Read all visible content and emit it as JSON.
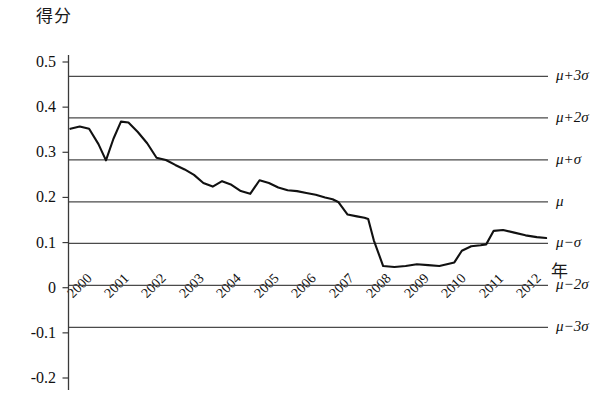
{
  "chart_data": {
    "type": "line",
    "title": "",
    "ylabel": "得分",
    "xlabel": "年",
    "ylim": [
      -0.2,
      0.5
    ],
    "xlim": [
      2000,
      2012.8
    ],
    "grid": "horizontal-reference-lines-only",
    "legend": "none",
    "ytick_labels": [
      "0.5",
      "0.4",
      "0.3",
      "0.2",
      "0.1",
      "0",
      "-0.1",
      "-0.2"
    ],
    "ytick_values": [
      0.5,
      0.4,
      0.3,
      0.2,
      0.1,
      0,
      -0.1,
      -0.2
    ],
    "xtick_labels": [
      "2000",
      "2001",
      "2002",
      "2003",
      "2004",
      "2005",
      "2006",
      "2007",
      "2008",
      "2009",
      "2010",
      "2011",
      "2012"
    ],
    "xtick_values": [
      2000,
      2001,
      2002,
      2003,
      2004,
      2005,
      2006,
      2007,
      2008,
      2009,
      2010,
      2011,
      2012
    ],
    "reference_lines": [
      {
        "label": "μ+3σ",
        "value": 0.468
      },
      {
        "label": "μ+2σ",
        "value": 0.376
      },
      {
        "label": "μ+σ",
        "value": 0.283
      },
      {
        "label": "μ",
        "value": 0.19
      },
      {
        "label": "μ−σ",
        "value": 0.098
      },
      {
        "label": "μ−2σ",
        "value": 0.005
      },
      {
        "label": "μ−3σ",
        "value": -0.088
      }
    ],
    "series": [
      {
        "name": "得分",
        "x": [
          2000.05,
          2000.3,
          2000.55,
          2000.8,
          2001.0,
          2001.2,
          2001.4,
          2001.6,
          2001.85,
          2002.1,
          2002.35,
          2002.6,
          2002.85,
          2003.1,
          2003.35,
          2003.6,
          2003.85,
          2004.1,
          2004.35,
          2004.6,
          2004.85,
          2005.1,
          2005.35,
          2005.6,
          2005.85,
          2006.1,
          2006.35,
          2006.6,
          2006.85,
          2007.05,
          2007.2,
          2007.45,
          2007.7,
          2007.9,
          2008.0,
          2008.15,
          2008.4,
          2008.7,
          2009.0,
          2009.3,
          2009.6,
          2009.9,
          2010.1,
          2010.3,
          2010.5,
          2010.75,
          2011.0,
          2011.15,
          2011.35,
          2011.6,
          2011.9,
          2012.2,
          2012.5,
          2012.75
        ],
        "y": [
          0.352,
          0.357,
          0.352,
          0.318,
          0.282,
          0.33,
          0.368,
          0.366,
          0.345,
          0.32,
          0.288,
          0.283,
          0.272,
          0.262,
          0.25,
          0.232,
          0.224,
          0.236,
          0.228,
          0.214,
          0.208,
          0.238,
          0.232,
          0.222,
          0.216,
          0.214,
          0.21,
          0.206,
          0.2,
          0.196,
          0.19,
          0.162,
          0.158,
          0.155,
          0.152,
          0.105,
          0.048,
          0.046,
          0.048,
          0.052,
          0.05,
          0.048,
          0.052,
          0.056,
          0.082,
          0.092,
          0.094,
          0.096,
          0.126,
          0.128,
          0.122,
          0.116,
          0.112,
          0.11
        ]
      }
    ]
  }
}
